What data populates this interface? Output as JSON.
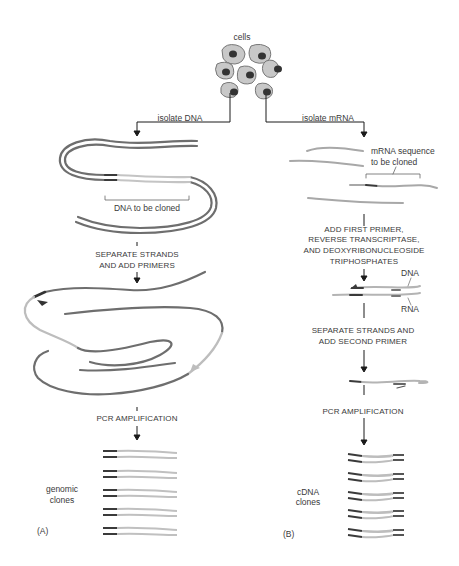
{
  "figure": {
    "top_label": "cells",
    "panel_a": {
      "step1": "isolate DNA",
      "bracket_label": "DNA to be cloned",
      "step2_line1": "SEPARATE STRANDS",
      "step2_line2": "AND ADD PRIMERS",
      "step3": "PCR AMPLIFICATION",
      "result_line1": "genomic",
      "result_line2": "clones",
      "panel_tag": "(A)"
    },
    "panel_b": {
      "step1": "isolate mRNA",
      "bracket_line1": "mRNA sequence",
      "bracket_line2": "to be cloned",
      "step2_line1": "ADD FIRST PRIMER,",
      "step2_line2": "REVERSE TRANSCRIPTASE,",
      "step2_line3": "AND DEOXYRIBONUCLEOSIDE",
      "step2_line4": "TRIPHOSPHATES",
      "strand_dna": "DNA",
      "strand_rna": "RNA",
      "step3_line1": "SEPARATE STRANDS AND",
      "step3_line2": "ADD SECOND PRIMER",
      "step4": "PCR AMPLIFICATION",
      "result_line1": "cDNA",
      "result_line2": "clones",
      "panel_tag": "(B)"
    },
    "colors": {
      "strand_dark": "#6e6e6e",
      "strand_light": "#b9b9b9",
      "primer": "#3a3a3a",
      "cell_fill": "#c8c8c8",
      "nucleus": "#333333",
      "arrow": "#1a1a1a"
    }
  }
}
